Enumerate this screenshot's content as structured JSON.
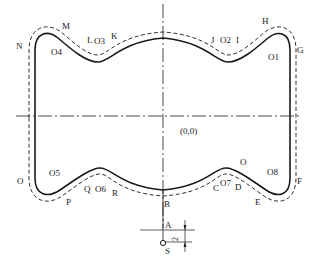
{
  "diagram": {
    "type": "cnc-contour-toolpath",
    "colors": {
      "line": "#1a1a1a",
      "background": "#ffffff"
    },
    "origin_label": "(0,0)",
    "dimension_label": "2",
    "start_point": {
      "label": "S"
    },
    "approach_point": {
      "label": "A"
    },
    "contour_points": {
      "B": "B",
      "C": "C",
      "D": "D",
      "E": "E",
      "F": "F",
      "G": "G",
      "H": "H",
      "I": "I",
      "J": "J",
      "K": "K",
      "L": "L",
      "M": "M",
      "N": "N",
      "O_left": "O",
      "O_right": "O",
      "P": "P",
      "Q": "Q",
      "R": "R"
    },
    "arc_centers": {
      "O1": "O1",
      "O2": "O2",
      "O3": "O3",
      "O4": "O4",
      "O5": "O5",
      "O6": "O6",
      "O7": "O7",
      "O8": "O8"
    }
  }
}
